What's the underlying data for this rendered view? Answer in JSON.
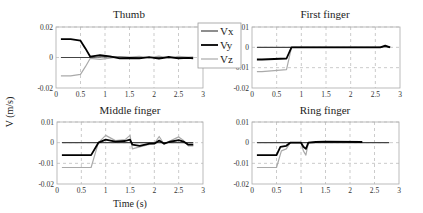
{
  "figure": {
    "ylabel": "V (m/s)",
    "xlabel": "Time (s)"
  },
  "legend": {
    "items": [
      {
        "label": "Vx",
        "color": "#444444",
        "width": 1.2
      },
      {
        "label": "Vy",
        "color": "#000000",
        "width": 1.8
      },
      {
        "label": "Vz",
        "color": "#aaaaaa",
        "width": 1.2
      }
    ]
  },
  "chart_data": [
    {
      "type": "line",
      "title": "Thumb",
      "xlabel": "",
      "ylabel": "V (m/s)",
      "xlim": [
        0,
        3
      ],
      "ylim": [
        -0.02,
        0.02
      ],
      "xticks": [
        "0",
        "0.5",
        "1",
        "1.5",
        "2",
        "2.5",
        "3"
      ],
      "yticks": [
        "0.02",
        "0",
        "-0.02"
      ],
      "grid": true,
      "series": [
        {
          "name": "Vx",
          "x": [
            0.1,
            0.5,
            0.7,
            1.0,
            1.5,
            2.0,
            2.5,
            2.8
          ],
          "values": [
            0,
            0,
            0,
            0.0005,
            0,
            0,
            0,
            0
          ]
        },
        {
          "name": "Vy",
          "x": [
            0.1,
            0.3,
            0.5,
            0.6,
            0.7,
            0.9,
            1.1,
            1.3,
            1.5,
            1.7,
            1.9,
            2.1,
            2.3,
            2.5,
            2.7,
            2.8
          ],
          "values": [
            0.012,
            0.012,
            0.011,
            0.006,
            0.0005,
            0.0015,
            0.0008,
            -0.0005,
            -0.0003,
            -0.0006,
            0.0002,
            -0.0007,
            0.0003,
            -0.0006,
            -0.0002,
            -0.0005
          ]
        },
        {
          "name": "Vz",
          "x": [
            0.1,
            0.3,
            0.5,
            0.6,
            0.7,
            0.9,
            1.1,
            1.3,
            1.5,
            1.7,
            1.9,
            2.1,
            2.3,
            2.5,
            2.7,
            2.8
          ],
          "values": [
            -0.012,
            -0.012,
            -0.011,
            -0.006,
            -0.0005,
            -0.0012,
            -0.0004,
            0.0006,
            0.0003,
            0.0007,
            -0.0002,
            0.0009,
            -0.0003,
            0.0008,
            0.0002,
            0.0004
          ]
        }
      ],
      "legend_position": "right"
    },
    {
      "type": "line",
      "title": "First finger",
      "xlim": [
        0,
        3
      ],
      "ylim": [
        -0.02,
        0.01
      ],
      "xticks": [
        "0",
        "0.5",
        "1",
        "1.5",
        "2",
        "2.5",
        "3"
      ],
      "yticks": [
        "0.01",
        "0",
        "-0.01",
        "-0.02"
      ],
      "grid": true,
      "series": [
        {
          "name": "Vx",
          "x": [
            0.1,
            0.8,
            2.6,
            2.7,
            2.8
          ],
          "values": [
            0,
            0,
            0,
            0.0005,
            0
          ]
        },
        {
          "name": "Vy",
          "x": [
            0.1,
            0.2,
            0.7,
            0.8,
            2.6,
            2.7,
            2.8
          ],
          "values": [
            -0.006,
            -0.006,
            -0.0055,
            0,
            0,
            0.0008,
            0
          ]
        },
        {
          "name": "Vz",
          "x": [
            0.1,
            0.2,
            0.7,
            0.8,
            2.6,
            2.7,
            2.8
          ],
          "values": [
            -0.012,
            -0.012,
            -0.011,
            0,
            0,
            0.0004,
            0
          ]
        }
      ]
    },
    {
      "type": "line",
      "title": "Middle finger",
      "xlabel": "Time (s)",
      "xlim": [
        0,
        3
      ],
      "ylim": [
        -0.02,
        0.01
      ],
      "xticks": [
        "0",
        "0.5",
        "1",
        "1.5",
        "2",
        "2.5",
        "3"
      ],
      "yticks": [
        "0.01",
        "0",
        "-0.01",
        "-0.02"
      ],
      "grid": true,
      "series": [
        {
          "name": "Vx",
          "x": [
            0.1,
            0.85,
            1.5,
            2.0,
            2.8
          ],
          "values": [
            0,
            0,
            0,
            0,
            0
          ]
        },
        {
          "name": "Vy",
          "x": [
            0.1,
            0.7,
            0.85,
            1.0,
            1.2,
            1.4,
            1.5,
            1.55,
            1.7,
            1.9,
            2.0,
            2.1,
            2.2,
            2.3,
            2.5,
            2.6,
            2.7,
            2.8
          ],
          "values": [
            -0.006,
            -0.006,
            0,
            0.0015,
            0.0005,
            0.0008,
            0.0015,
            -0.001,
            -0.0015,
            -0.0005,
            -0.0005,
            0.001,
            -0.0005,
            0.0003,
            0.0012,
            0.0005,
            -0.001,
            -0.001
          ]
        },
        {
          "name": "Vz",
          "x": [
            0.1,
            0.7,
            0.85,
            1.0,
            1.2,
            1.4,
            1.5,
            1.55,
            1.7,
            1.9,
            2.0,
            2.1,
            2.2,
            2.3,
            2.5,
            2.6,
            2.7,
            2.8
          ],
          "values": [
            -0.012,
            -0.012,
            0,
            0.0035,
            0.001,
            0.0015,
            0.0035,
            -0.003,
            -0.002,
            -0.0008,
            -0.0005,
            0.003,
            -0.0008,
            0.0005,
            0.0028,
            0.001,
            -0.0015,
            -0.0015
          ]
        }
      ]
    },
    {
      "type": "line",
      "title": "Ring finger",
      "xlim": [
        0,
        3
      ],
      "ylim": [
        -0.02,
        0.01
      ],
      "xticks": [
        "0",
        "0.5",
        "1",
        "1.5",
        "2",
        "2.5",
        "3"
      ],
      "yticks": [
        "0.01",
        "0",
        "-0.01",
        "-0.02"
      ],
      "grid": true,
      "series": [
        {
          "name": "Vx",
          "x": [
            0.1,
            1.0,
            1.3,
            2.25,
            2.8
          ],
          "values": [
            0,
            0,
            0,
            0,
            0
          ]
        },
        {
          "name": "Vy",
          "x": [
            0.1,
            0.5,
            0.58,
            0.7,
            0.78,
            1.0,
            1.05,
            1.1,
            1.15,
            1.3,
            1.5,
            2.25
          ],
          "values": [
            -0.006,
            -0.006,
            -0.002,
            -0.0015,
            0,
            0,
            -0.002,
            -0.003,
            0,
            0.0003,
            0.0005,
            0.0003
          ]
        },
        {
          "name": "Vz",
          "x": [
            0.1,
            0.5,
            0.6,
            0.7,
            0.78,
            1.0,
            1.05,
            1.1,
            1.15,
            1.3,
            1.5,
            2.25
          ],
          "values": [
            -0.012,
            -0.012,
            -0.004,
            -0.003,
            0,
            0,
            -0.004,
            -0.006,
            0,
            0.0002,
            0.0003,
            0.0002
          ]
        }
      ]
    }
  ]
}
